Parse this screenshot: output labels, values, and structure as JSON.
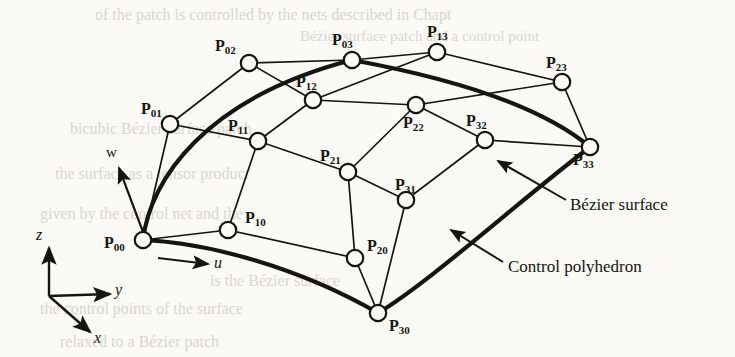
{
  "figure": {
    "background_color": "#fbfaf7",
    "ink_color": "#17150f"
  },
  "control_points": [
    {
      "name": "P00",
      "base": "P",
      "sub": "00",
      "cx": 143,
      "cy": 240,
      "label_x": 104,
      "label_y": 235
    },
    {
      "name": "P01",
      "base": "P",
      "sub": "01",
      "cx": 170,
      "cy": 124,
      "label_x": 141,
      "label_y": 101
    },
    {
      "name": "P02",
      "base": "P",
      "sub": "02",
      "cx": 249,
      "cy": 63,
      "label_x": 215,
      "label_y": 38
    },
    {
      "name": "P03",
      "base": "P",
      "sub": "03",
      "cx": 352,
      "cy": 60,
      "label_x": 332,
      "label_y": 32
    },
    {
      "name": "P10",
      "base": "P",
      "sub": "10",
      "cx": 228,
      "cy": 230,
      "label_x": 245,
      "label_y": 210
    },
    {
      "name": "P11",
      "base": "P",
      "sub": "11",
      "cx": 258,
      "cy": 141,
      "label_x": 228,
      "label_y": 118
    },
    {
      "name": "P12",
      "base": "P",
      "sub": "12",
      "cx": 313,
      "cy": 100,
      "label_x": 296,
      "label_y": 74
    },
    {
      "name": "P13",
      "base": "P",
      "sub": "13",
      "cx": 437,
      "cy": 52,
      "label_x": 427,
      "label_y": 24
    },
    {
      "name": "P20",
      "base": "P",
      "sub": "20",
      "cx": 355,
      "cy": 258,
      "label_x": 367,
      "label_y": 238
    },
    {
      "name": "P21",
      "base": "P",
      "sub": "21",
      "cx": 348,
      "cy": 172,
      "label_x": 320,
      "label_y": 148
    },
    {
      "name": "P22",
      "base": "P",
      "sub": "22",
      "cx": 416,
      "cy": 105,
      "label_x": 403,
      "label_y": 115
    },
    {
      "name": "P23",
      "base": "P",
      "sub": "23",
      "cx": 562,
      "cy": 82,
      "label_x": 546,
      "label_y": 55
    },
    {
      "name": "P30",
      "base": "P",
      "sub": "30",
      "cx": 378,
      "cy": 313,
      "label_x": 389,
      "label_y": 318
    },
    {
      "name": "P31",
      "base": "P",
      "sub": "31",
      "cx": 406,
      "cy": 200,
      "label_x": 395,
      "label_y": 177
    },
    {
      "name": "P32",
      "base": "P",
      "sub": "32",
      "cx": 485,
      "cy": 140,
      "label_x": 466,
      "label_y": 113
    },
    {
      "name": "P33",
      "base": "P",
      "sub": "33",
      "cx": 590,
      "cy": 147,
      "label_x": 573,
      "label_y": 152
    }
  ],
  "axes": {
    "origin": {
      "x": 49,
      "y": 296
    },
    "z": {
      "label": "z",
      "tip_x": 49,
      "tip_y": 248,
      "label_x": 36,
      "label_y": 227
    },
    "y": {
      "label": "y",
      "tip_x": 110,
      "tip_y": 294,
      "label_x": 115,
      "label_y": 282
    },
    "x": {
      "label": "x",
      "tip_x": 90,
      "tip_y": 332,
      "label_x": 94,
      "label_y": 330
    }
  },
  "parameter_arrows": [
    {
      "label": "u",
      "x1": 158,
      "y1": 258,
      "x2": 208,
      "y2": 264,
      "label_x": 214,
      "label_y": 255
    },
    {
      "label": "w",
      "x1": 143,
      "y1": 232,
      "x2": 119,
      "y2": 168,
      "label_x": 106,
      "label_y": 145
    }
  ],
  "annotations": [
    {
      "label": "Bézier surface",
      "label_x": 570,
      "label_y": 196,
      "leader_x1": 566,
      "leader_y1": 200,
      "leader_x2": 498,
      "leader_y2": 161
    },
    {
      "label": "Control polyhedron",
      "label_x": 508,
      "label_y": 258,
      "leader_x1": 503,
      "leader_y1": 262,
      "leader_x2": 451,
      "leader_y2": 230
    }
  ],
  "ghost_text": [
    {
      "text": "of the patch is controlled by the nets described in Chapt",
      "x": 95,
      "y": 6,
      "size": 16
    },
    {
      "text": "Bézier surface patch and a control point",
      "x": 300,
      "y": 28,
      "size": 15
    },
    {
      "text": "bicubic Bézier surface patch",
      "x": 70,
      "y": 120,
      "size": 16
    },
    {
      "text": "the surface as a tensor product",
      "x": 55,
      "y": 165,
      "size": 16
    },
    {
      "text": "given by the control net and the",
      "x": 40,
      "y": 205,
      "size": 16
    },
    {
      "text": "is the Bézier surface",
      "x": 210,
      "y": 272,
      "size": 16
    },
    {
      "text": "the control points of the surface",
      "x": 40,
      "y": 300,
      "size": 16
    },
    {
      "text": "relaxed to a Bézier patch",
      "x": 60,
      "y": 333,
      "size": 16
    }
  ]
}
